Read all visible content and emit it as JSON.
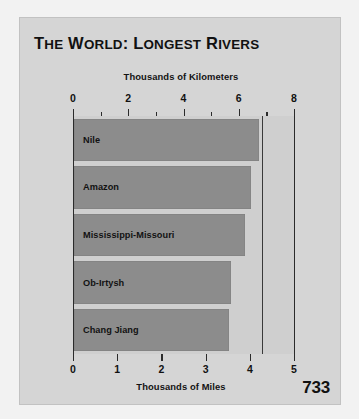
{
  "page": {
    "page_number": "733",
    "panel_background": "#d5d5d5",
    "plot_background": "#cfcfcf",
    "bar_color": "#8c8c8c",
    "axis_color": "#2b2b2b"
  },
  "chart_data": {
    "type": "bar",
    "orientation": "horizontal",
    "title": "The World: Longest Rivers",
    "title_display": "THE WORLD: LONGEST RIVERS",
    "categories": [
      "Nile",
      "Amazon",
      "Mississippi-Missouri",
      "Ob-Irtysh",
      "Chang Jiang"
    ],
    "values_km": [
      6.7,
      6.4,
      6.2,
      5.7,
      5.6
    ],
    "values_miles": [
      4.16,
      4.0,
      3.9,
      3.57,
      3.5
    ],
    "xlabel_top": "Thousands of Kilometers",
    "xlabel_bottom": "Thousands of Miles",
    "ylabel": "",
    "xlim_km": [
      0,
      8
    ],
    "xlim_miles": [
      0,
      5
    ],
    "top_ticks": [
      {
        "value": 0,
        "label": "0",
        "major": true
      },
      {
        "value": 1,
        "label": "",
        "major": false
      },
      {
        "value": 2,
        "label": "2",
        "major": true
      },
      {
        "value": 3,
        "label": "",
        "major": false
      },
      {
        "value": 4,
        "label": "4",
        "major": true
      },
      {
        "value": 5,
        "label": "",
        "major": false
      },
      {
        "value": 6,
        "label": "6",
        "major": true
      },
      {
        "value": 7,
        "label": "",
        "major": false
      },
      {
        "value": 8,
        "label": "8",
        "major": true
      }
    ],
    "bottom_ticks": [
      {
        "value": 0,
        "label": "0",
        "major": true
      },
      {
        "value": 1,
        "label": "1",
        "major": true
      },
      {
        "value": 2,
        "label": "2",
        "major": true
      },
      {
        "value": 3,
        "label": "3",
        "major": true
      },
      {
        "value": 4,
        "label": "4",
        "major": true
      },
      {
        "value": 5,
        "label": "5",
        "major": true
      }
    ],
    "grid": false,
    "legend": null
  }
}
